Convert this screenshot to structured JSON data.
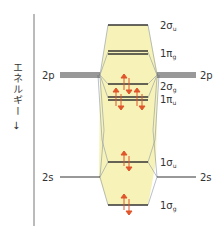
{
  "axis": {
    "label": "エネルギー",
    "arrow": "→"
  },
  "atomic_orbitals": {
    "left": [
      {
        "label": "2p",
        "y": 75
      },
      {
        "label": "2s",
        "y": 177
      }
    ],
    "right": [
      {
        "label": "2p",
        "y": 75
      },
      {
        "label": "2s",
        "y": 177
      }
    ]
  },
  "molecular_orbitals": [
    {
      "main": "2σ",
      "sub": "u",
      "y": 25,
      "electrons": 0
    },
    {
      "main": "1π",
      "sub": "g",
      "y": 52,
      "electrons": 0
    },
    {
      "main": "2σ",
      "sub": "g",
      "y": 84,
      "electrons": 2
    },
    {
      "main": "1π",
      "sub": "u",
      "y": 98,
      "electrons": 4
    },
    {
      "main": "1σ",
      "sub": "u",
      "y": 162,
      "electrons": 2
    },
    {
      "main": "1σ",
      "sub": "g",
      "y": 205,
      "electrons": 2
    }
  ],
  "colors": {
    "band": "#f7f3b8",
    "level": "#333333",
    "electron": "#e0552a",
    "connector": "#8a96a8"
  }
}
